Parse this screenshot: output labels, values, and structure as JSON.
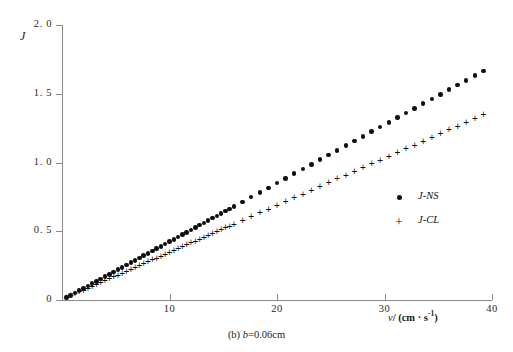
{
  "figure": {
    "caption_prefix": "(b)",
    "caption_symbol": "b",
    "caption_value": "=0.06cm"
  },
  "axes": {
    "y_title": "J",
    "x_title_symbol": "v",
    "x_title_rest": "/ (cm · s",
    "x_title_exp": "-1",
    "x_title_close": ")",
    "y_ticks": [
      "0",
      "0. 5",
      "1. 0",
      "1. 5",
      "2. 0"
    ],
    "x_ticks": [
      "10",
      "20",
      "30",
      "40"
    ]
  },
  "legend": {
    "entries": [
      {
        "label": "J-NS",
        "marker": "dot-marker"
      },
      {
        "label": "J-CL",
        "marker": "plus-marker"
      }
    ]
  },
  "chart_data": {
    "type": "scatter",
    "title": "(b) b=0.06cm",
    "xlabel": "v/ (cm · s⁻¹)",
    "ylabel": "J",
    "xlim": [
      0,
      40
    ],
    "ylim": [
      0,
      2.0
    ],
    "xticks": [
      10,
      20,
      30,
      40
    ],
    "yticks": [
      0,
      0.5,
      1.0,
      1.5,
      2.0
    ],
    "grid": false,
    "legend_position": "right-middle",
    "series": [
      {
        "name": "J-NS",
        "marker": "filled-circle",
        "color": "#0d0d0d",
        "x": [
          0.4,
          0.8,
          1.2,
          1.6,
          2.0,
          2.4,
          2.8,
          3.2,
          3.6,
          4.0,
          4.4,
          4.8,
          5.2,
          5.6,
          6.0,
          6.4,
          6.8,
          7.2,
          7.6,
          8.0,
          8.4,
          8.8,
          9.2,
          9.6,
          10.0,
          10.4,
          10.8,
          11.2,
          11.6,
          12.0,
          12.4,
          12.8,
          13.2,
          13.6,
          14.0,
          14.4,
          14.8,
          15.2,
          15.6,
          16.0,
          16.8,
          17.6,
          18.4,
          19.2,
          20.0,
          20.8,
          21.6,
          22.4,
          23.2,
          24.0,
          24.8,
          25.6,
          26.4,
          27.2,
          28.0,
          28.8,
          29.6,
          30.4,
          31.2,
          32.0,
          32.8,
          33.6,
          34.4,
          35.2,
          36.0,
          36.8,
          37.6,
          38.4,
          39.2
        ],
        "y": [
          0.017,
          0.034,
          0.051,
          0.068,
          0.085,
          0.102,
          0.119,
          0.136,
          0.153,
          0.17,
          0.187,
          0.204,
          0.221,
          0.238,
          0.255,
          0.272,
          0.289,
          0.306,
          0.323,
          0.34,
          0.357,
          0.374,
          0.391,
          0.408,
          0.425,
          0.442,
          0.459,
          0.476,
          0.493,
          0.51,
          0.527,
          0.544,
          0.561,
          0.578,
          0.595,
          0.612,
          0.629,
          0.646,
          0.663,
          0.68,
          0.714,
          0.748,
          0.782,
          0.816,
          0.85,
          0.884,
          0.918,
          0.952,
          0.986,
          1.02,
          1.054,
          1.088,
          1.122,
          1.156,
          1.19,
          1.224,
          1.258,
          1.292,
          1.326,
          1.36,
          1.394,
          1.428,
          1.462,
          1.496,
          1.53,
          1.564,
          1.598,
          1.632,
          1.666
        ]
      },
      {
        "name": "J-CL",
        "marker": "plus",
        "color": "#0d0d0d",
        "x": [
          0.4,
          0.8,
          1.2,
          1.6,
          2.0,
          2.4,
          2.8,
          3.2,
          3.6,
          4.0,
          4.4,
          4.8,
          5.2,
          5.6,
          6.0,
          6.4,
          6.8,
          7.2,
          7.6,
          8.0,
          8.4,
          8.8,
          9.2,
          9.6,
          10.0,
          10.4,
          10.8,
          11.2,
          11.6,
          12.0,
          12.4,
          12.8,
          13.2,
          13.6,
          14.0,
          14.4,
          14.8,
          15.2,
          15.6,
          16.0,
          16.8,
          17.6,
          18.4,
          19.2,
          20.0,
          20.8,
          21.6,
          22.4,
          23.2,
          24.0,
          24.8,
          25.6,
          26.4,
          27.2,
          28.0,
          28.8,
          29.6,
          30.4,
          31.2,
          32.0,
          32.8,
          33.6,
          34.4,
          35.2,
          36.0,
          36.8,
          37.6,
          38.4,
          39.2
        ],
        "y": [
          0.0137,
          0.0274,
          0.0411,
          0.0548,
          0.0685,
          0.0822,
          0.0959,
          0.1096,
          0.1233,
          0.137,
          0.1507,
          0.1644,
          0.1781,
          0.1918,
          0.2055,
          0.2192,
          0.2329,
          0.2466,
          0.2603,
          0.274,
          0.2877,
          0.3014,
          0.3151,
          0.3288,
          0.3425,
          0.3562,
          0.3699,
          0.3836,
          0.3973,
          0.411,
          0.4247,
          0.4384,
          0.4521,
          0.4658,
          0.4795,
          0.4932,
          0.5069,
          0.5206,
          0.5343,
          0.548,
          0.5754,
          0.6028,
          0.6302,
          0.6576,
          0.685,
          0.7124,
          0.7398,
          0.7672,
          0.7946,
          0.822,
          0.8494,
          0.8768,
          0.9042,
          0.9316,
          0.959,
          0.9864,
          1.0138,
          1.0412,
          1.0686,
          1.096,
          1.1234,
          1.1508,
          1.1782,
          1.2056,
          1.233,
          1.2604,
          1.2878,
          1.3152,
          1.3426
        ]
      }
    ]
  }
}
